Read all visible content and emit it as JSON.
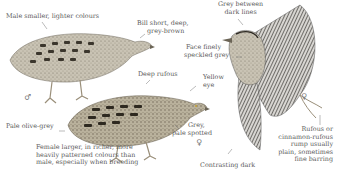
{
  "figure": {
    "annotations": {
      "male_note": "Male smaller, lighter colours",
      "bill": [
        "Bill short, deep,",
        "grey-brown"
      ],
      "head_lines": [
        "Grey between",
        "dark lines"
      ],
      "face": [
        "Face finely",
        "speckled grey"
      ],
      "deep_rufous": "Deep rufous",
      "eye": [
        "Yellow",
        "eye"
      ],
      "pale_olive": "Pale olive-grey",
      "grey_spotted": [
        "Grey,",
        "pale spotted"
      ],
      "female_note": [
        "Female larger, in richer, more",
        "heavily patterned colours than",
        "male, especially when breeding"
      ],
      "contrasting": "Contrasting dark",
      "rump": [
        "Rufous or",
        "cinnamon-rufous",
        "rump usually",
        "plain, sometimes",
        "fine barring"
      ]
    },
    "symbols": {
      "male": "♂",
      "female_1": "♀",
      "female_2": "♀"
    }
  }
}
